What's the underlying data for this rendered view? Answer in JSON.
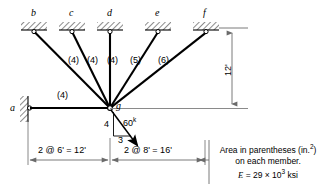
{
  "figure": {
    "type": "structural-truss-diagram",
    "joint_labels": [
      "a",
      "b",
      "c",
      "d",
      "e",
      "f",
      "g"
    ],
    "supports": [
      {
        "name": "a",
        "label": "a",
        "kind": "pin-wall-vertical",
        "x": 28,
        "y": 108
      },
      {
        "name": "b",
        "label": "b",
        "kind": "pin-wall-horizontal",
        "x": 34,
        "y": 30
      },
      {
        "name": "c",
        "label": "c",
        "kind": "pin-wall-horizontal",
        "x": 72,
        "y": 30
      },
      {
        "name": "d",
        "label": "d",
        "kind": "pin-wall-horizontal",
        "x": 110,
        "y": 30
      },
      {
        "name": "e",
        "label": "e",
        "kind": "pin-wall-horizontal",
        "x": 158,
        "y": 30
      },
      {
        "name": "f",
        "label": "f",
        "kind": "pin-wall-horizontal",
        "x": 206,
        "y": 30
      }
    ],
    "free_joint": {
      "name": "g",
      "label": "g",
      "x": 110,
      "y": 108
    },
    "members": [
      {
        "from": "a",
        "to": "g",
        "area_label": "(4)",
        "area": 4
      },
      {
        "from": "b",
        "to": "g",
        "area_label": "(4)",
        "area": 4
      },
      {
        "from": "c",
        "to": "g",
        "area_label": "(4)",
        "area": 4
      },
      {
        "from": "d",
        "to": "g",
        "area_label": "(4)",
        "area": 4
      },
      {
        "from": "e",
        "to": "g",
        "area_label": "(5)",
        "area": 5
      },
      {
        "from": "f",
        "to": "g",
        "area_label": "(6)",
        "area": 6
      }
    ],
    "load": {
      "magnitude_text": "60",
      "magnitude_unit": "k",
      "slope_vertical": "4",
      "slope_horizontal": "3",
      "applied_at": "g",
      "direction": "down-right"
    },
    "dimensions": {
      "left_span": "2 @ 6' = 12'",
      "right_span": "2 @ 8' = 16'",
      "height": "12'"
    },
    "note": {
      "line1": "Area in parentheses (in.",
      "line1_sup": "2",
      "line1_end": ")",
      "line2": "on each member.",
      "line3_e": "E",
      "line3_eq": " = 29 × 10",
      "line3_sup": "3",
      "line3_unit": " ksi"
    },
    "colors": {
      "ink": "#000000",
      "dimension_gray": "#6b6b6b",
      "background": "#ffffff"
    }
  }
}
